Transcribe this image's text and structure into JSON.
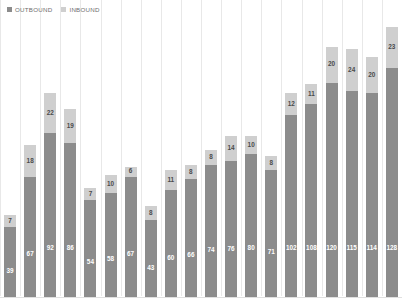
{
  "legend": {
    "position": "top-left",
    "items": [
      {
        "label": "OUTBOUND",
        "color": "#8c8c8c",
        "key": "outbound"
      },
      {
        "label": "INBOUND",
        "color": "#cfcfcf",
        "key": "inbound"
      }
    ]
  },
  "colors": {
    "outbound": "#8c8c8c",
    "inbound": "#cfcfcf",
    "gridline": "#e8e8e8",
    "background": "#ffffff",
    "outbound_label": "#ffffff",
    "inbound_label": "#4a4a4a"
  },
  "chart_data": {
    "type": "bar",
    "stacked": true,
    "title": "",
    "subtitle": "",
    "xlabel": "",
    "ylabel": "",
    "categories": [
      "1",
      "2",
      "3",
      "4",
      "5",
      "6",
      "7",
      "8",
      "9",
      "10",
      "11",
      "12",
      "13",
      "14",
      "15",
      "16",
      "17",
      "18",
      "19",
      "20"
    ],
    "tick_labels": [],
    "grid": {
      "vertical": true,
      "horizontal": false
    },
    "ylim": [
      0,
      160
    ],
    "series": [
      {
        "name": "OUTBOUND",
        "color": "#8c8c8c",
        "values": [
          39,
          67,
          92,
          86,
          54,
          58,
          67,
          43,
          60,
          66,
          74,
          76,
          80,
          71,
          102,
          108,
          120,
          115,
          114,
          128
        ]
      },
      {
        "name": "INBOUND",
        "color": "#cfcfcf",
        "values": [
          7,
          18,
          22,
          19,
          7,
          10,
          6,
          8,
          11,
          8,
          8,
          14,
          10,
          8,
          12,
          11,
          20,
          24,
          20,
          23
        ]
      }
    ],
    "totals": [
      46,
      85,
      114,
      105,
      61,
      68,
      73,
      51,
      71,
      74,
      82,
      90,
      90,
      79,
      114,
      119,
      140,
      139,
      134,
      151
    ],
    "annotations": []
  }
}
